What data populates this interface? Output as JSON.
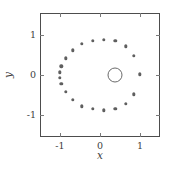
{
  "figure": {
    "background": "#ffffff",
    "frame_color": "#4d4d4d",
    "point_color": "#5f5f5f",
    "circle_color": "#6a6a6a"
  },
  "chart_data": {
    "type": "scatter",
    "title": "",
    "xlabel": "x",
    "ylabel": "y",
    "xlim": [
      -1.5,
      1.5
    ],
    "ylim": [
      -1.55,
      1.55
    ],
    "xticks": [
      -1,
      0,
      1
    ],
    "yticks": [
      -1,
      0,
      1
    ],
    "xticklabels": [
      "-1",
      "0",
      "1"
    ],
    "yticklabels": [
      "-1",
      "0",
      "1"
    ],
    "grid": false,
    "legend": null,
    "series": [
      {
        "name": "points",
        "marker": "filled-dot",
        "color": "#5f5f5f",
        "points": [
          [
            1.0,
            0.02
          ],
          [
            0.85,
            0.48
          ],
          [
            0.65,
            0.72
          ],
          [
            0.38,
            0.85
          ],
          [
            0.1,
            0.88
          ],
          [
            -0.18,
            0.85
          ],
          [
            -0.45,
            0.78
          ],
          [
            -0.68,
            0.62
          ],
          [
            -0.86,
            0.42
          ],
          [
            -0.97,
            0.22
          ],
          [
            -1.0,
            0.07
          ],
          [
            -1.0,
            -0.07
          ],
          [
            -0.97,
            -0.22
          ],
          [
            -0.86,
            -0.42
          ],
          [
            -0.68,
            -0.62
          ],
          [
            -0.45,
            -0.78
          ],
          [
            -0.18,
            -0.85
          ],
          [
            0.1,
            -0.88
          ],
          [
            0.38,
            -0.85
          ],
          [
            0.65,
            -0.72
          ],
          [
            0.85,
            -0.48
          ]
        ]
      },
      {
        "name": "open-circle-marker",
        "marker": "open-circle",
        "color": "#6a6a6a",
        "radius_px": 6.5,
        "points": [
          [
            0.38,
            0.0
          ]
        ]
      }
    ]
  }
}
